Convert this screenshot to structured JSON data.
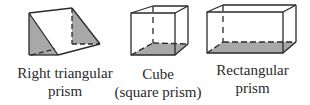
{
  "figure": {
    "shapes": [
      {
        "id": "right-triangular-prism",
        "label_lines": [
          "Right triangular",
          "prism"
        ],
        "shaded": "two triangular end faces"
      },
      {
        "id": "cube",
        "label_lines": [
          "Cube",
          "(square prism)"
        ],
        "shaded": "bottom face"
      },
      {
        "id": "rectangular-prism",
        "label_lines": [
          "Rectangular",
          "prism"
        ],
        "shaded": "bottom face"
      }
    ],
    "colors": {
      "edge": "#2a2a2a",
      "shade": "#a8a8a8",
      "background": "#ffffff"
    }
  }
}
